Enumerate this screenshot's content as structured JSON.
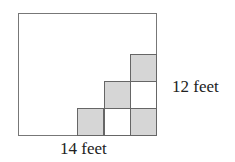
{
  "diagram": {
    "labels": {
      "height": "12 feet",
      "width": "14 feet"
    },
    "colors": {
      "filled": "#d6d6d6",
      "border": "#666666"
    },
    "squares": [
      {
        "row": 0,
        "col": 3,
        "filled": true
      },
      {
        "row": 1,
        "col": 2,
        "filled": true
      },
      {
        "row": 1,
        "col": 3,
        "filled": false
      },
      {
        "row": 2,
        "col": 1,
        "filled": true
      },
      {
        "row": 2,
        "col": 2,
        "filled": false
      },
      {
        "row": 2,
        "col": 3,
        "filled": true
      }
    ]
  }
}
